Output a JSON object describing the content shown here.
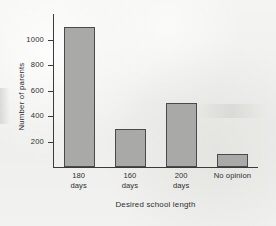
{
  "chart_data": {
    "type": "bar",
    "title": "",
    "xlabel": "Desired school length",
    "ylabel": "Number of parents",
    "categories": [
      "180 days",
      "160 days",
      "200 days",
      "No opinion"
    ],
    "category_lines": [
      {
        "line1": "180",
        "line2": "days"
      },
      {
        "line1": "160",
        "line2": "days"
      },
      {
        "line1": "200",
        "line2": "days"
      },
      {
        "line1": "No opinion",
        "line2": ""
      }
    ],
    "values": [
      1100,
      300,
      500,
      100
    ],
    "ylim": [
      0,
      1200
    ],
    "yticks": [
      200,
      400,
      600,
      800,
      1000
    ],
    "ytick_labels": [
      "200",
      "400",
      "600",
      "800",
      "1000"
    ],
    "grid": false,
    "legend": false,
    "bar_fill_color": "#a9a9a7",
    "bar_edge_color": "#4a4a4a",
    "axis_color": "#3b3b3b",
    "background_color": "#f1f1ef"
  }
}
